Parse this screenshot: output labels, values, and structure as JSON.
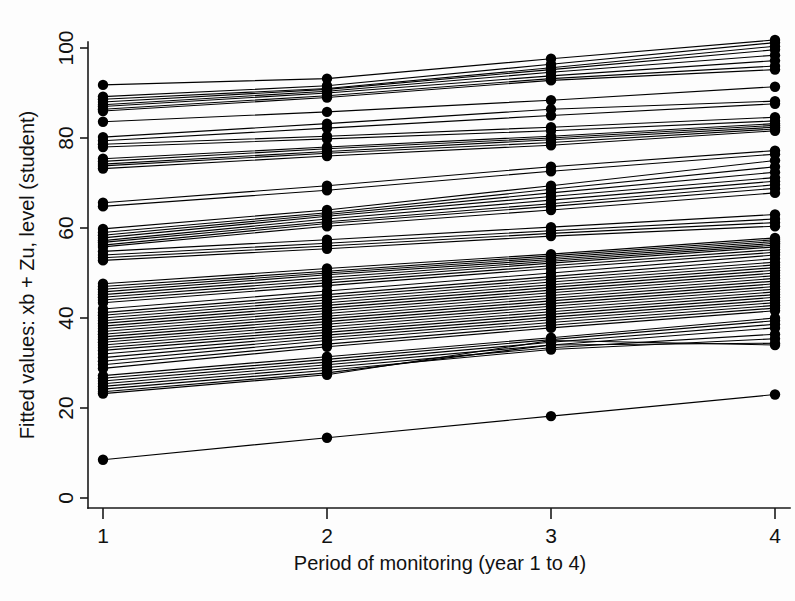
{
  "chart_data": {
    "type": "line",
    "title": "",
    "subtitle": "",
    "xlabel": "Period of monitoring (year 1 to 4)",
    "ylabel": "Fitted values: xb + Zu, level (student)",
    "x": [
      1,
      2,
      3,
      4
    ],
    "xtick_labels": [
      "1",
      "2",
      "3",
      "4"
    ],
    "ytick_labels": [
      "0",
      "20",
      "40",
      "60",
      "80",
      "100"
    ],
    "ytick_values": [
      0,
      20,
      40,
      60,
      80,
      100
    ],
    "xlim": [
      0.88,
      4.1
    ],
    "ylim": [
      0,
      106
    ],
    "grid": false,
    "legend": false,
    "legend_position": "none",
    "marker": "filled-circle",
    "marker_size": 5.2,
    "line_color": "#000000",
    "annotations": [],
    "series_note": "Student-level fitted trajectories (spaghetti plot); each series is one student measured at 4 monitoring periods",
    "series": [
      {
        "name": "s01",
        "values": [
          91.8,
          93.2,
          97.6,
          101.8
        ]
      },
      {
        "name": "s02",
        "values": [
          89.2,
          91.6,
          96.4,
          101.2
        ]
      },
      {
        "name": "s03",
        "values": [
          88.6,
          91.0,
          95.6,
          100.4
        ]
      },
      {
        "name": "s04",
        "values": [
          88.0,
          90.8,
          95.2,
          99.6
        ]
      },
      {
        "name": "s05",
        "values": [
          87.4,
          90.4,
          94.6,
          98.4
        ]
      },
      {
        "name": "s06",
        "values": [
          87.0,
          90.0,
          93.8,
          97.2
        ]
      },
      {
        "name": "s07",
        "values": [
          86.4,
          89.4,
          93.2,
          96.0
        ]
      },
      {
        "name": "s08",
        "values": [
          86.0,
          89.0,
          92.8,
          95.2
        ]
      },
      {
        "name": "s09",
        "values": [
          83.6,
          85.8,
          88.4,
          91.4
        ]
      },
      {
        "name": "s10",
        "values": [
          80.2,
          83.2,
          86.4,
          88.2
        ]
      },
      {
        "name": "s11",
        "values": [
          79.4,
          82.2,
          85.0,
          87.6
        ]
      },
      {
        "name": "s12",
        "values": [
          78.6,
          80.4,
          82.4,
          84.6
        ]
      },
      {
        "name": "s13",
        "values": [
          78.0,
          79.8,
          81.6,
          83.8
        ]
      },
      {
        "name": "s14",
        "values": [
          75.4,
          78.0,
          80.4,
          83.2
        ]
      },
      {
        "name": "s15",
        "values": [
          74.8,
          77.6,
          80.0,
          82.8
        ]
      },
      {
        "name": "s16",
        "values": [
          74.2,
          77.0,
          79.6,
          82.4
        ]
      },
      {
        "name": "s17",
        "values": [
          73.8,
          76.6,
          79.0,
          82.0
        ]
      },
      {
        "name": "s18",
        "values": [
          73.2,
          76.0,
          78.4,
          81.6
        ]
      },
      {
        "name": "s19",
        "values": [
          65.6,
          69.4,
          73.6,
          77.2
        ]
      },
      {
        "name": "s20",
        "values": [
          64.8,
          68.4,
          72.6,
          76.4
        ]
      },
      {
        "name": "s21",
        "values": [
          59.8,
          64.0,
          69.4,
          75.0
        ]
      },
      {
        "name": "s22",
        "values": [
          59.0,
          63.4,
          68.6,
          73.6
        ]
      },
      {
        "name": "s23",
        "values": [
          58.4,
          63.0,
          67.8,
          72.4
        ]
      },
      {
        "name": "s24",
        "values": [
          57.8,
          62.6,
          67.0,
          71.2
        ]
      },
      {
        "name": "s25",
        "values": [
          57.2,
          62.0,
          66.2,
          70.4
        ]
      },
      {
        "name": "s26",
        "values": [
          56.8,
          61.4,
          65.4,
          69.6
        ]
      },
      {
        "name": "s27",
        "values": [
          56.2,
          61.0,
          64.8,
          68.8
        ]
      },
      {
        "name": "s28",
        "values": [
          55.8,
          60.4,
          64.0,
          67.8
        ]
      },
      {
        "name": "s29",
        "values": [
          54.8,
          57.4,
          60.2,
          63.0
        ]
      },
      {
        "name": "s30",
        "values": [
          54.0,
          56.6,
          59.4,
          62.0
        ]
      },
      {
        "name": "s31",
        "values": [
          53.4,
          56.0,
          58.8,
          61.2
        ]
      },
      {
        "name": "s32",
        "values": [
          52.8,
          55.4,
          58.2,
          60.4
        ]
      },
      {
        "name": "s33",
        "values": [
          47.6,
          51.0,
          54.2,
          57.8
        ]
      },
      {
        "name": "s34",
        "values": [
          47.0,
          50.4,
          53.8,
          57.4
        ]
      },
      {
        "name": "s35",
        "values": [
          46.4,
          50.0,
          53.4,
          57.0
        ]
      },
      {
        "name": "s36",
        "values": [
          45.8,
          49.6,
          53.0,
          56.6
        ]
      },
      {
        "name": "s37",
        "values": [
          45.2,
          49.0,
          52.6,
          56.2
        ]
      },
      {
        "name": "s38",
        "values": [
          44.6,
          48.4,
          52.2,
          55.8
        ]
      },
      {
        "name": "s39",
        "values": [
          44.0,
          47.8,
          51.6,
          55.2
        ]
      },
      {
        "name": "s40",
        "values": [
          43.4,
          47.2,
          51.0,
          54.6
        ]
      },
      {
        "name": "s41",
        "values": [
          42.0,
          46.0,
          50.0,
          54.0
        ]
      },
      {
        "name": "s42",
        "values": [
          41.2,
          45.2,
          49.2,
          53.2
        ]
      },
      {
        "name": "s43",
        "values": [
          40.6,
          44.6,
          48.6,
          52.4
        ]
      },
      {
        "name": "s44",
        "values": [
          40.0,
          44.0,
          48.0,
          51.8
        ]
      },
      {
        "name": "s45",
        "values": [
          39.4,
          43.4,
          47.4,
          51.2
        ]
      },
      {
        "name": "s46",
        "values": [
          38.8,
          42.8,
          46.8,
          50.6
        ]
      },
      {
        "name": "s47",
        "values": [
          38.2,
          42.2,
          46.2,
          50.0
        ]
      },
      {
        "name": "s48",
        "values": [
          37.6,
          41.6,
          45.6,
          49.4
        ]
      },
      {
        "name": "s49",
        "values": [
          37.0,
          41.0,
          45.0,
          48.8
        ]
      },
      {
        "name": "s50",
        "values": [
          36.4,
          40.4,
          44.4,
          48.2
        ]
      },
      {
        "name": "s51",
        "values": [
          35.8,
          39.8,
          43.8,
          47.6
        ]
      },
      {
        "name": "s52",
        "values": [
          35.2,
          39.2,
          43.2,
          47.0
        ]
      },
      {
        "name": "s53",
        "values": [
          34.6,
          38.6,
          42.6,
          46.4
        ]
      },
      {
        "name": "s54",
        "values": [
          34.0,
          38.0,
          42.0,
          45.8
        ]
      },
      {
        "name": "s55",
        "values": [
          33.4,
          37.4,
          41.4,
          45.2
        ]
      },
      {
        "name": "s56",
        "values": [
          32.8,
          36.8,
          40.8,
          44.6
        ]
      },
      {
        "name": "s57",
        "values": [
          32.0,
          36.2,
          40.2,
          44.0
        ]
      },
      {
        "name": "s58",
        "values": [
          31.2,
          35.6,
          39.6,
          43.4
        ]
      },
      {
        "name": "s59",
        "values": [
          30.4,
          35.0,
          39.0,
          42.8
        ]
      },
      {
        "name": "s60",
        "values": [
          29.6,
          34.2,
          38.4,
          42.2
        ]
      },
      {
        "name": "s61",
        "values": [
          28.8,
          33.6,
          37.8,
          41.6
        ]
      },
      {
        "name": "s62",
        "values": [
          27.2,
          31.4,
          35.6,
          40.0
        ]
      },
      {
        "name": "s63",
        "values": [
          26.6,
          30.8,
          35.2,
          39.4
        ]
      },
      {
        "name": "s64",
        "values": [
          26.0,
          30.2,
          34.6,
          38.6
        ]
      },
      {
        "name": "s65",
        "values": [
          25.4,
          29.6,
          34.0,
          37.8
        ]
      },
      {
        "name": "s66",
        "values": [
          24.8,
          29.0,
          33.4,
          36.4
        ]
      },
      {
        "name": "s67",
        "values": [
          24.2,
          28.4,
          33.0,
          35.4
        ]
      },
      {
        "name": "s68",
        "values": [
          23.6,
          27.8,
          34.0,
          34.4
        ]
      },
      {
        "name": "s69",
        "values": [
          23.2,
          27.4,
          35.0,
          34.0
        ]
      },
      {
        "name": "s70",
        "values": [
          8.5,
          13.4,
          18.2,
          23.0
        ]
      }
    ]
  },
  "axes": {
    "y_title": "Fitted values: xb + Zu, level (student)",
    "x_title": "Period of monitoring (year 1 to 4)"
  }
}
